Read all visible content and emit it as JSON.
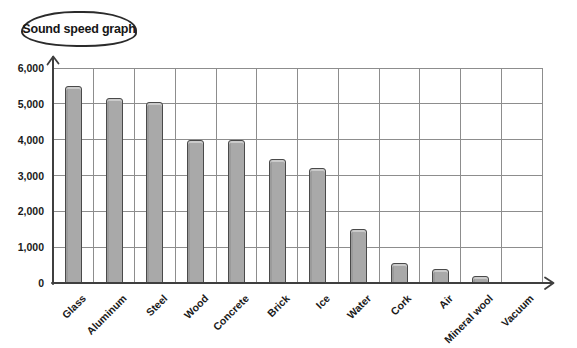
{
  "title": "Sound speed graph",
  "chart_data": {
    "type": "bar",
    "title": "Sound speed graph",
    "categories": [
      "Glass",
      "Aluminum",
      "Steel",
      "Wood",
      "Concrete",
      "Brick",
      "Ice",
      "Water",
      "Cork",
      "Air",
      "Mineral wool",
      "Vacuum"
    ],
    "values": [
      5500,
      5150,
      5050,
      4000,
      4000,
      3450,
      3200,
      1500,
      550,
      400,
      200,
      0
    ],
    "xlabel": "",
    "ylabel": "",
    "ylim": [
      0,
      6000
    ],
    "ytick_interval": 1000,
    "ytick_labels": [
      "0",
      "1,000",
      "2,000",
      "3,000",
      "4,000",
      "5,000",
      "6,000"
    ],
    "grid": true,
    "legend": false,
    "bar_color": "#a9a9a9",
    "bar_border_color": "#4a4a4a",
    "grid_color": "#8d8d8d",
    "axis_color": "#3f3f3f",
    "text_color": "#1a1a1a"
  }
}
